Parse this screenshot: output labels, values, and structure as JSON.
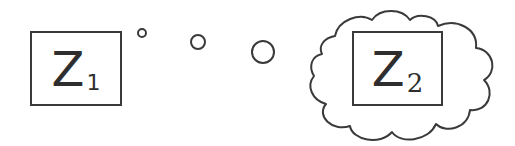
{
  "diagram": {
    "z1": {
      "letter": "Z",
      "subscript": "1"
    },
    "z2": {
      "letter": "Z",
      "subscript": "2"
    },
    "thought_bubbles": [
      {
        "cx": 142,
        "cy": 33,
        "r": 4
      },
      {
        "cx": 198,
        "cy": 42,
        "r": 7
      },
      {
        "cx": 263,
        "cy": 52,
        "r": 11
      }
    ],
    "stroke_color": "#3a3a3a"
  }
}
